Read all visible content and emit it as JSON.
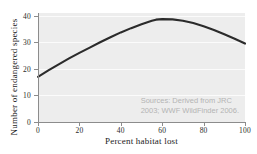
{
  "chart_data": {
    "type": "line",
    "title": "",
    "xlabel": "Percent habitat lost",
    "ylabel": "Number of endangered species",
    "xlim": [
      0,
      100
    ],
    "ylim": [
      0,
      41
    ],
    "grid": true,
    "legend": false,
    "x_ticks": [
      "0",
      "20",
      "40",
      "60",
      "80",
      "100"
    ],
    "x_tick_values": [
      0,
      20,
      40,
      60,
      80,
      100
    ],
    "y_ticks": [
      "0",
      "10",
      "20",
      "30",
      "40"
    ],
    "y_tick_values": [
      0,
      10,
      20,
      30,
      40
    ],
    "gridline_values": [
      10,
      20,
      30,
      40
    ],
    "series": [
      {
        "name": "Endangered species vs habitat lost",
        "color": "#2b2b2b",
        "x": [
          0,
          5,
          10,
          15,
          20,
          25,
          30,
          35,
          40,
          45,
          50,
          55,
          57,
          60,
          65,
          70,
          75,
          80,
          85,
          90,
          95,
          100
        ],
        "values": [
          17.0,
          19.4,
          21.7,
          23.9,
          26.0,
          28.0,
          30.0,
          31.9,
          33.7,
          35.3,
          36.8,
          38.1,
          38.5,
          38.7,
          38.6,
          38.1,
          37.2,
          36.0,
          34.6,
          33.0,
          31.3,
          29.5
        ]
      }
    ],
    "annotations": [
      {
        "name": "source-note",
        "lines": [
          "Sources: Derived from JRC",
          "2003; WWF WildFinder 2006."
        ],
        "color": "#b4b4b4",
        "position": "bottom-right-inside-plot"
      }
    ],
    "colors": {
      "plot_background": "#ededed",
      "figure_background": "#ffffff",
      "gridline": "#fbfbfb",
      "axis": "#8c8c8c",
      "curve": "#2b2b2b",
      "tick_label": "#2a2a2a",
      "axis_title": "#1a1a1a"
    }
  }
}
